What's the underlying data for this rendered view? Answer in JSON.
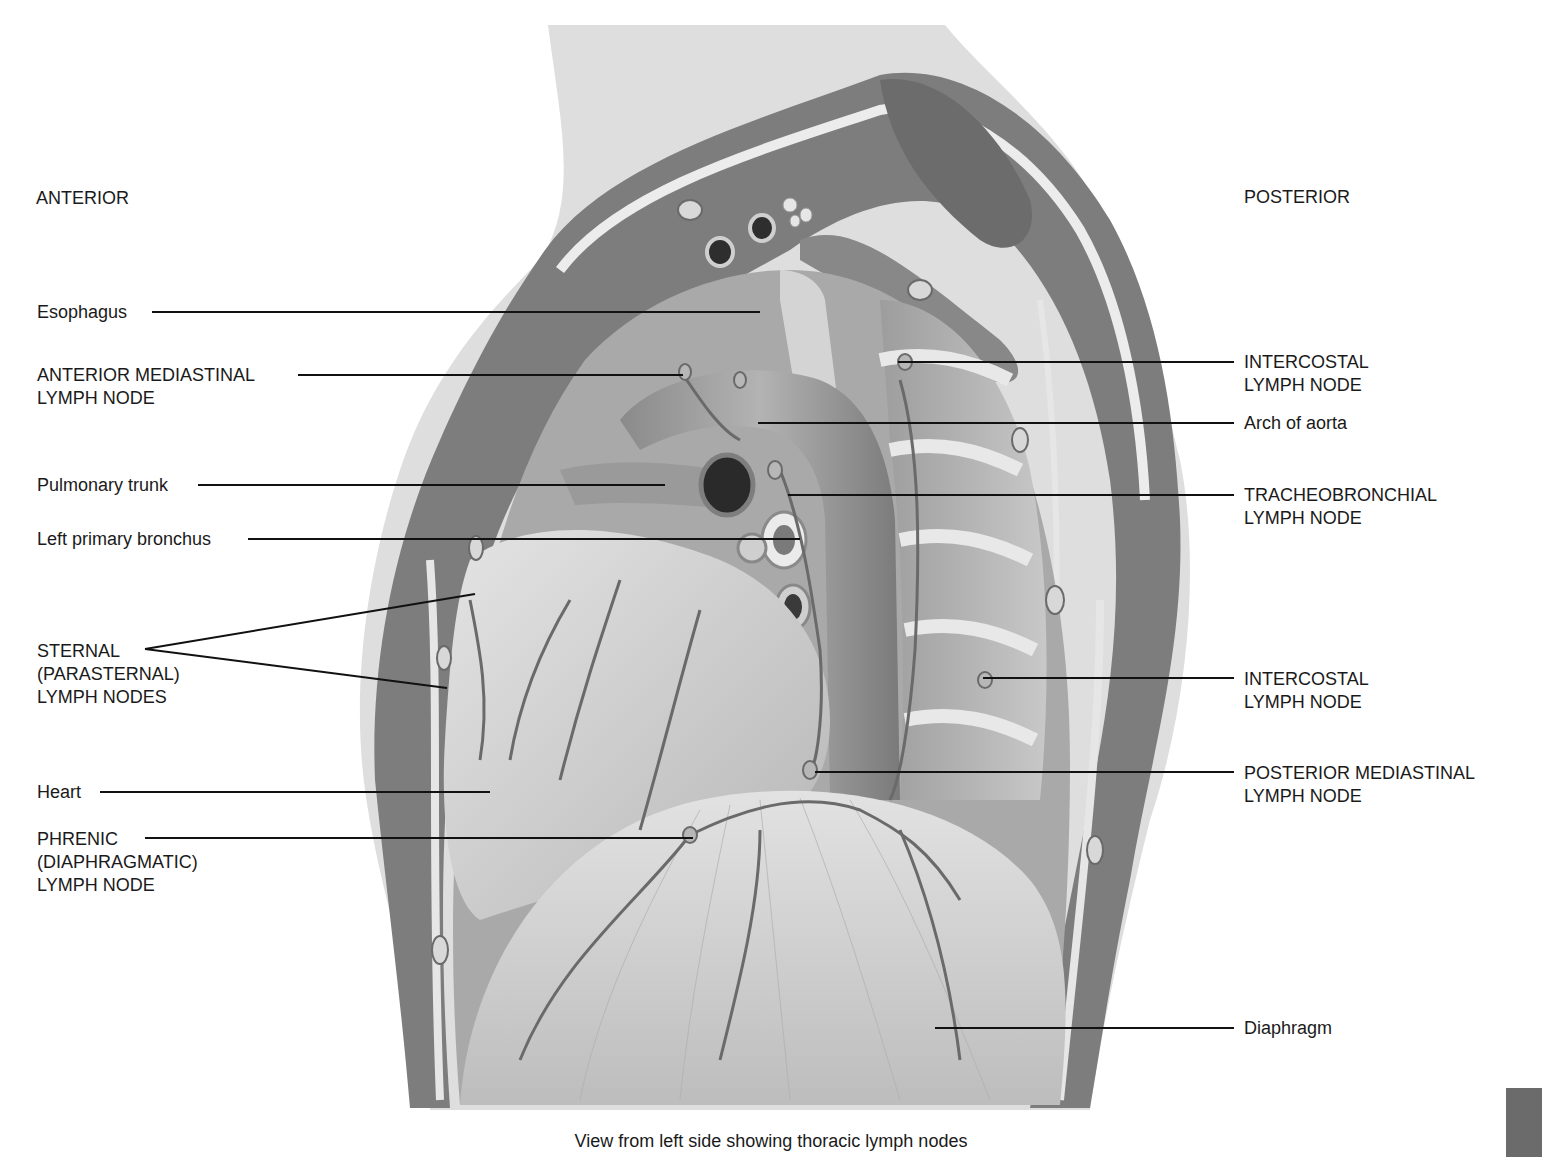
{
  "figure": {
    "caption": "View from left side showing thoracic lymph nodes",
    "orientation": {
      "left": "ANTERIOR",
      "right": "POSTERIOR"
    },
    "labels_left": [
      {
        "id": "esophagus",
        "text": "Esophagus"
      },
      {
        "id": "anterior-mediastinal",
        "text": "ANTERIOR MEDIASTINAL\nLYMPH NODE"
      },
      {
        "id": "pulmonary-trunk",
        "text": "Pulmonary trunk"
      },
      {
        "id": "left-primary-bronchus",
        "text": "Left primary bronchus"
      },
      {
        "id": "sternal",
        "text": "STERNAL\n(PARASTERNAL)\nLYMPH NODES"
      },
      {
        "id": "heart",
        "text": "Heart"
      },
      {
        "id": "phrenic",
        "text": "PHRENIC\n(DIAPHRAGMATIC)\nLYMPH NODE"
      }
    ],
    "labels_right": [
      {
        "id": "intercostal-upper",
        "text": "INTERCOSTAL\nLYMPH NODE"
      },
      {
        "id": "arch-of-aorta",
        "text": "Arch of aorta"
      },
      {
        "id": "tracheobronchial",
        "text": "TRACHEOBRONCHIAL\nLYMPH NODE"
      },
      {
        "id": "intercostal-lower",
        "text": "INTERCOSTAL\nLYMPH NODE"
      },
      {
        "id": "posterior-mediastinal",
        "text": "POSTERIOR MEDIASTINAL\nLYMPH NODE"
      },
      {
        "id": "diaphragm",
        "text": "Diaphragm"
      }
    ]
  },
  "colors": {
    "background": "#ffffff",
    "text": "#1a1a1a",
    "leader_line": "#111111",
    "skin": "#dcdcdc",
    "muscle": "#7a7a7a",
    "fascia": "#e6e6e6",
    "organ_light": "#cfcfcf",
    "organ_mid": "#a8a8a8",
    "vessel": "#6e6e6e",
    "page_tab": "#6b6b6b"
  }
}
